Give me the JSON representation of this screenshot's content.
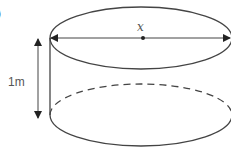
{
  "figure": {
    "type": "cylinder",
    "partial_label": ")",
    "height_label": "1m",
    "diameter_label": "x",
    "colors": {
      "stroke": "#444444",
      "background": "#ffffff"
    }
  }
}
